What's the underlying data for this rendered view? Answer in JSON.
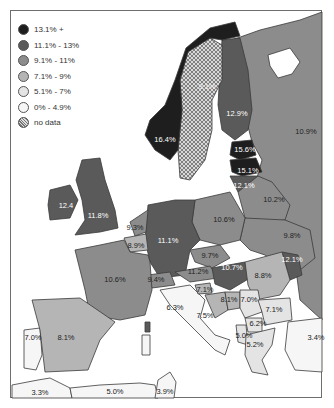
{
  "map": {
    "type": "choropleth",
    "region": "Europe",
    "legend": [
      {
        "label": "13.1% +",
        "color": "#1e1e1e"
      },
      {
        "label": "11.1% - 13%",
        "color": "#5a5a5a"
      },
      {
        "label": "9.1% - 11%",
        "color": "#8c8c8c"
      },
      {
        "label": "7.1% - 9%",
        "color": "#b5b5b5"
      },
      {
        "label": "5.1% - 7%",
        "color": "#e4e4e4"
      },
      {
        "label": "0% - 4.9%",
        "color": "#f6f6f6"
      },
      {
        "label": "no data",
        "color": "hatch"
      }
    ],
    "regions": [
      {
        "name": "Norway",
        "value": "16.4%"
      },
      {
        "name": "Sweden",
        "value": "9.1%"
      },
      {
        "name": "Finland",
        "value": "12.9%"
      },
      {
        "name": "Russia",
        "value": "10.9%"
      },
      {
        "name": "Estonia",
        "value": "15.6%"
      },
      {
        "name": "Latvia",
        "value": "15.1%"
      },
      {
        "name": "Lithuania",
        "value": "12.1%"
      },
      {
        "name": "Belarus",
        "value": "10.2%"
      },
      {
        "name": "Ukraine",
        "value": "9.8%"
      },
      {
        "name": "Poland",
        "value": "10.6%"
      },
      {
        "name": "Ireland",
        "value": "12.4"
      },
      {
        "name": "United Kingdom",
        "value": "11.8%"
      },
      {
        "name": "France",
        "value": "10.6%"
      },
      {
        "name": "Germany",
        "value": "11.1%"
      },
      {
        "name": "Netherlands",
        "value": "9.3%"
      },
      {
        "name": "Belgium",
        "value": "8.9%"
      },
      {
        "name": "Switzerland",
        "value": "9.4%"
      },
      {
        "name": "Czech Republic",
        "value": "10.7%"
      },
      {
        "name": "Austria",
        "value": "9.7%"
      },
      {
        "name": "Hungary",
        "value": "11.2%"
      },
      {
        "name": "Moldova",
        "value": "12.1%"
      },
      {
        "name": "Romania",
        "value": "8.8%"
      },
      {
        "name": "Slovenia",
        "value": "7.1%"
      },
      {
        "name": "Croatia",
        "value": "7.5%"
      },
      {
        "name": "Bosnia",
        "value": "8.1%"
      },
      {
        "name": "Serbia",
        "value": "7.0%"
      },
      {
        "name": "Bulgaria",
        "value": "7.1%"
      },
      {
        "name": "Macedonia",
        "value": "6.2%"
      },
      {
        "name": "Albania",
        "value": "5.0%"
      },
      {
        "name": "Greece",
        "value": "5.2%"
      },
      {
        "name": "Italy",
        "value": "6.3%"
      },
      {
        "name": "Turkey",
        "value": "3.4%"
      },
      {
        "name": "Portugal",
        "value": "7.0%"
      },
      {
        "name": "Spain",
        "value": "8.1%"
      },
      {
        "name": "Morocco",
        "value": "3.3%"
      },
      {
        "name": "Algeria",
        "value": "5.0%"
      },
      {
        "name": "Tunisia",
        "value": "3.9%"
      }
    ]
  }
}
